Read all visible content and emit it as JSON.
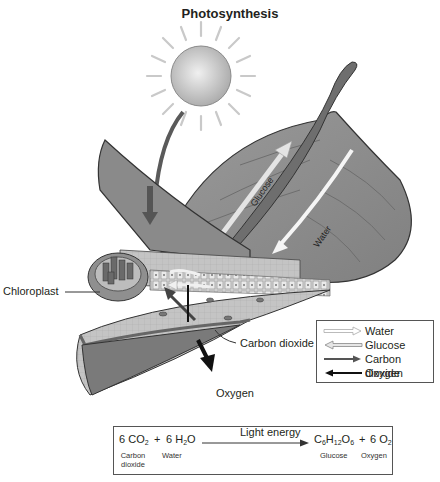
{
  "title": "Photosynthesis",
  "labels": {
    "chloroplast": "Chloroplast",
    "carbon_dioxide": "Carbon dioxide",
    "oxygen": "Oxygen",
    "glucose_vein": "Glucose",
    "water_vein": "Water"
  },
  "legend": {
    "items": [
      {
        "label": "Water",
        "arrow": "hollow-light",
        "color": "#bdbdbd"
      },
      {
        "label": "Glucose",
        "arrow": "hollow-left",
        "color": "#8c8c8c"
      },
      {
        "label": "Carbon dioxide",
        "arrow": "solid-right",
        "color": "#555555"
      },
      {
        "label": "Oxygen",
        "arrow": "solid-left",
        "color": "#111111"
      }
    ]
  },
  "equation": {
    "reactant1": {
      "coef": "6",
      "formula": "CO",
      "sub": "2",
      "name": "Carbon dioxide"
    },
    "plus1": "+",
    "reactant2": {
      "coef": "6",
      "formula_a": "H",
      "sub": "2",
      "formula_b": "O",
      "name": "Water"
    },
    "arrow_label": "Light energy",
    "product1": {
      "c": "C",
      "c_sub": "6",
      "h": "H",
      "h_sub": "12",
      "o": "O",
      "o_sub": "6",
      "name": "Glucose"
    },
    "plus2": "+",
    "product2": {
      "coef": "6",
      "formula": "O",
      "sub": "2",
      "name": "Oxygen"
    }
  },
  "colors": {
    "leaf": "#8e8e8e",
    "leaf_dark": "#5f5f5f",
    "sun": "#c8c8c8",
    "outline": "#333333"
  }
}
